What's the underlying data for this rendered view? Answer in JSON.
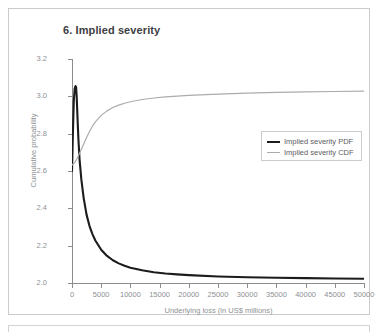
{
  "chart_data": {
    "type": "line",
    "title": "6. Implied severity",
    "xlabel": "Underlying loss (in US$ millions)",
    "ylabel": "Cumulative probability",
    "xlim": [
      0,
      50000
    ],
    "ylim": [
      2.0,
      3.2
    ],
    "grid": false,
    "legend_position": "center-right",
    "xticks": [
      0,
      5000,
      10000,
      15000,
      20000,
      25000,
      30000,
      35000,
      40000,
      45000,
      50000
    ],
    "xtick_labels": [
      "0",
      "5000",
      "10000",
      "15000",
      "20000",
      "25000",
      "30000",
      "35000",
      "40000",
      "45000",
      "50000"
    ],
    "yticks": [
      2.0,
      2.2,
      2.4,
      2.6,
      2.8,
      3.0,
      3.2
    ],
    "ytick_labels": [
      "2.0",
      "2.2",
      "2.4",
      "2.6",
      "2.8",
      "3.0",
      "3.2"
    ],
    "series": [
      {
        "name": "Implied severity PDF",
        "color": "#1c1c1c",
        "width": 2.1,
        "x": [
          0,
          150,
          300,
          450,
          600,
          700,
          800,
          950,
          1100,
          1300,
          1600,
          2000,
          2500,
          3000,
          3500,
          4000,
          5000,
          6000,
          7000,
          8000,
          9000,
          10000,
          12000,
          14000,
          16000,
          18000,
          20000,
          25000,
          30000,
          35000,
          40000,
          45000,
          50000
        ],
        "y": [
          2.6,
          2.8,
          2.97,
          3.04,
          3.055,
          3.05,
          3.0,
          2.88,
          2.77,
          2.66,
          2.555,
          2.455,
          2.365,
          2.305,
          2.262,
          2.228,
          2.178,
          2.145,
          2.122,
          2.105,
          2.092,
          2.082,
          2.068,
          2.058,
          2.051,
          2.046,
          2.042,
          2.035,
          2.031,
          2.028,
          2.026,
          2.024,
          2.023
        ]
      },
      {
        "name": "Implied severity CDF",
        "color": "#a9acae",
        "width": 1.2,
        "x": [
          0,
          300,
          600,
          900,
          1200,
          1600,
          2000,
          2500,
          3000,
          3500,
          4000,
          5000,
          6000,
          7000,
          8000,
          9000,
          10000,
          12000,
          14000,
          16000,
          18000,
          20000,
          25000,
          30000,
          35000,
          40000,
          45000,
          50000
        ],
        "y": [
          2.632,
          2.64,
          2.652,
          2.668,
          2.688,
          2.716,
          2.745,
          2.78,
          2.812,
          2.84,
          2.863,
          2.898,
          2.922,
          2.94,
          2.953,
          2.963,
          2.971,
          2.983,
          2.991,
          2.997,
          3.001,
          3.005,
          3.012,
          3.017,
          3.021,
          3.024,
          3.026,
          3.028
        ]
      }
    ],
    "legend": [
      {
        "label": "Implied severity PDF",
        "style": "thick-dark"
      },
      {
        "label": "Implied severity CDF",
        "style": "thin-gray"
      }
    ]
  },
  "colors": {
    "frame": "#c9cbcd",
    "axis": "#8b8e91",
    "tick_text": "#8e9194",
    "title_text": "#3d4043",
    "pdf_line": "#1c1c1c",
    "cdf_line": "#a9acae"
  }
}
